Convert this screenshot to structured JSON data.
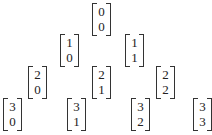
{
  "rows": [
    [
      {
        "n": "0",
        "k": "0"
      }
    ],
    [
      {
        "n": "1",
        "k": "0"
      },
      {
        "n": "1",
        "k": "1"
      }
    ],
    [
      {
        "n": "2",
        "k": "0"
      },
      {
        "n": "2",
        "k": "1"
      },
      {
        "n": "2",
        "k": "2"
      }
    ],
    [
      {
        "n": "3",
        "k": "0"
      },
      {
        "n": "3",
        "k": "1"
      },
      {
        "n": "3",
        "k": "2"
      },
      {
        "n": "3",
        "k": "3"
      }
    ]
  ]
}
